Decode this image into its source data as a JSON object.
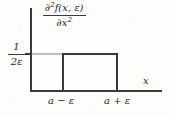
{
  "figure": {
    "title": "",
    "axes": {
      "x_axis_label": "x",
      "y_axis_value_label": {
        "numerator": "1",
        "denominator": "2ε"
      },
      "x_tick_labels": [
        "a − ε",
        "a + ε"
      ]
    },
    "expression": {
      "numerator_prefix": "∂",
      "numerator_sup": "2",
      "numerator_rest": "f(x, ε)",
      "denominator_prefix": "∂x",
      "denominator_sup": "2"
    },
    "colors": {
      "curve": "#3a3a3a",
      "axis": "#3a3a3a",
      "guide": "#bdbdbd",
      "background": "#fdfdfc"
    }
  },
  "chart_data": {
    "type": "line",
    "title": "",
    "subtitle": "",
    "xlabel": "x",
    "ylabel": "∂²f(x, ε)/∂x²",
    "grid": false,
    "legend": null,
    "xlim": [
      0,
      1
    ],
    "ylim": [
      0,
      1
    ],
    "x_tick_labels": [
      "a − ε",
      "a + ε"
    ],
    "x_tick_values": [
      "a-epsilon",
      "a+epsilon"
    ],
    "y_tick_labels": [
      "1/(2ε)"
    ],
    "y_tick_values": [
      "1/(2*epsilon)"
    ],
    "series": [
      {
        "name": "second derivative of mollified step",
        "description": "rectangular pulse of height 1/(2ε) supported on [a−ε, a+ε], zero elsewhere",
        "points": [
          {
            "x": "left edge of axis",
            "y": 0
          },
          {
            "x": "a-epsilon",
            "y": 0
          },
          {
            "x": "a-epsilon",
            "y": "1/(2*epsilon)"
          },
          {
            "x": "a+epsilon",
            "y": "1/(2*epsilon)"
          },
          {
            "x": "a+epsilon",
            "y": 0
          },
          {
            "x": "right edge of axis",
            "y": 0
          }
        ]
      }
    ],
    "annotations": [
      {
        "text": "1/(2ε)",
        "role": "y-axis level marker"
      },
      {
        "text": "a − ε",
        "role": "x tick"
      },
      {
        "text": "a + ε",
        "role": "x tick"
      },
      {
        "text": "x",
        "role": "x axis name"
      }
    ]
  }
}
